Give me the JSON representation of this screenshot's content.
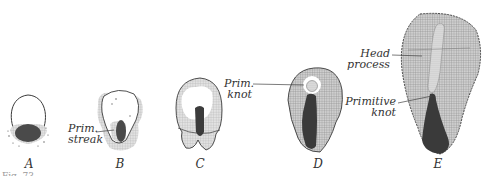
{
  "figure": {
    "panels": [
      {
        "id": "A",
        "label": "A",
        "x": 29
      },
      {
        "id": "B",
        "label": "B",
        "x": 120
      },
      {
        "id": "C",
        "label": "C",
        "x": 200
      },
      {
        "id": "D",
        "label": "D",
        "x": 318
      },
      {
        "id": "E",
        "label": "E",
        "x": 438
      }
    ],
    "annotations": {
      "prim_streak_line1": "Prim.",
      "prim_streak_line2": "streak",
      "prim_knot_line1": "Prim.",
      "prim_knot_line2": "knot",
      "head_process_line1": "Head",
      "head_process_line2": "process",
      "primitive_knot_line1": "Primitive",
      "primitive_knot_line2": "knot"
    },
    "caption_partial": "Fig. 73.—"
  },
  "colors": {
    "outline": "#3a3a3a",
    "hatch": "#9a9a9a",
    "streak_dark": "#3c3c3c",
    "background": "#ffffff"
  }
}
